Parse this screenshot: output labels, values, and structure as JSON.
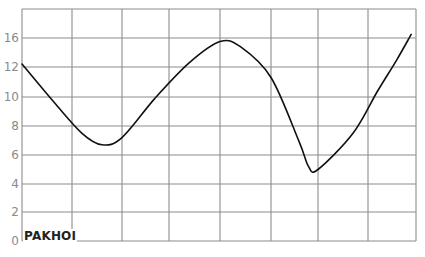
{
  "chart_data": {
    "type": "line",
    "title": "",
    "xlabel": "",
    "ylabel": "",
    "corner_label": "PAKHOI",
    "y_tick_labels": [
      "0",
      "2",
      "4",
      "6",
      "8",
      "10",
      "12",
      "16"
    ],
    "x_tick_labels": [],
    "grid": true,
    "legend": null,
    "columns": 8,
    "rows": 8,
    "series": [
      {
        "name": "PAKHOI",
        "color": "#111111",
        "points": [
          {
            "x": 0.0,
            "y": 12.4
          },
          {
            "x": 0.65,
            "y": 9.6
          },
          {
            "x": 1.2,
            "y": 7.5
          },
          {
            "x": 1.6,
            "y": 6.7
          },
          {
            "x": 2.0,
            "y": 7.2
          },
          {
            "x": 2.7,
            "y": 9.9
          },
          {
            "x": 3.4,
            "y": 12.6
          },
          {
            "x": 4.0,
            "y": 15.5
          },
          {
            "x": 4.4,
            "y": 14.8
          },
          {
            "x": 5.0,
            "y": 11.3
          },
          {
            "x": 5.6,
            "y": 6.9
          },
          {
            "x": 5.8,
            "y": 5.2
          },
          {
            "x": 6.0,
            "y": 5.0
          },
          {
            "x": 6.7,
            "y": 7.5
          },
          {
            "x": 7.2,
            "y": 10.4
          },
          {
            "x": 7.6,
            "y": 13.0
          },
          {
            "x": 7.9,
            "y": 16.5
          }
        ]
      }
    ],
    "ylim": [
      0,
      18
    ],
    "xlim": [
      0,
      8
    ]
  },
  "colors": {
    "grid": "#8c8c8c",
    "line": "#111111",
    "tick_text": "#8a8a8a",
    "background": "#ffffff"
  }
}
